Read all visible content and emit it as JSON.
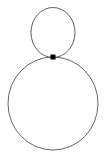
{
  "figure": {
    "kind": "geometric-diagram",
    "width": 106,
    "height": 157,
    "background_color": "#ffffff"
  },
  "style": {
    "stroke_color": "#4a4a52",
    "stroke_width": 0.9,
    "point_color": "#000000"
  },
  "shapes": [
    {
      "name": "small-circle",
      "type": "ellipse",
      "cx": 53,
      "cy": 32.5,
      "rx": 22,
      "ry": 25,
      "stroke": "#4a4a52",
      "stroke_width": 0.9
    },
    {
      "name": "large-circle",
      "type": "ellipse",
      "cx": 53,
      "cy": 103.5,
      "rx": 45,
      "ry": 46.5,
      "stroke": "#52525a",
      "stroke_width": 0.9
    }
  ],
  "points": [
    {
      "name": "basepoint",
      "type": "dot",
      "cx": 53,
      "cy": 57,
      "size": 5,
      "color": "#000000"
    }
  ],
  "labels": []
}
